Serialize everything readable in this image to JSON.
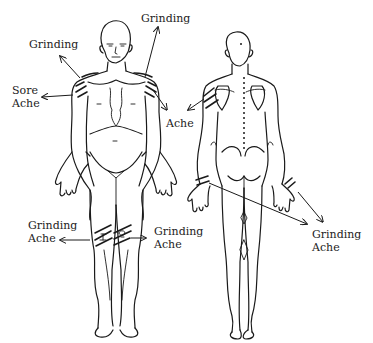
{
  "diagram": {
    "type": "body-pain-map",
    "figures": [
      {
        "id": "front",
        "label": "Front view"
      },
      {
        "id": "back",
        "label": "Back view"
      }
    ],
    "annotations": [
      {
        "id": "left-shoulder-top",
        "text": "Grinding",
        "x": 29,
        "y": 38
      },
      {
        "id": "right-shoulder-top",
        "text": "Grinding",
        "x": 141,
        "y": 12
      },
      {
        "id": "left-shoulder-side",
        "text": "Sore\nAche",
        "x": 12,
        "y": 84
      },
      {
        "id": "right-shoulder-side",
        "text": "Ache",
        "x": 166,
        "y": 117
      },
      {
        "id": "right-knee-left",
        "text": "Grinding\nAche",
        "x": 28,
        "y": 219
      },
      {
        "id": "left-knee-right",
        "text": "Grinding\nAche",
        "x": 154,
        "y": 225
      },
      {
        "id": "wrists",
        "text": "Grinding\nAche",
        "x": 312,
        "y": 228
      }
    ],
    "colors": {
      "line": "#1a1a1a",
      "background": "#ffffff"
    }
  }
}
